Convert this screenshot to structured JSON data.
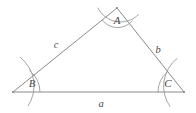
{
  "figure": {
    "type": "geometry-diagram",
    "shape": "triangle",
    "background_color": "#ffffff",
    "stroke_color": "#8a8a8a",
    "label_color": "#4a4a4a",
    "stroke_width": 1
  },
  "vertices": [
    {
      "id": "A",
      "label": "A",
      "x": 117,
      "y": 8,
      "label_x": 117,
      "label_y": 20
    },
    {
      "id": "B",
      "label": "B",
      "x": 13,
      "y": 92,
      "label_x": 32,
      "label_y": 83
    },
    {
      "id": "C",
      "label": "C",
      "x": 184,
      "y": 92,
      "label_x": 168,
      "label_y": 83
    }
  ],
  "sides": [
    {
      "id": "a",
      "label": "a",
      "between": "B-C",
      "label_x": 101,
      "label_y": 104
    },
    {
      "id": "b",
      "label": "b",
      "between": "A-C",
      "label_x": 158,
      "label_y": 50
    },
    {
      "id": "c",
      "label": "c",
      "between": "A-B",
      "label_x": 56,
      "label_y": 45
    }
  ],
  "angle_arcs": [
    {
      "at": "A",
      "kind": "inner"
    },
    {
      "at": "A",
      "kind": "outer"
    },
    {
      "at": "B",
      "kind": "inner"
    },
    {
      "at": "B",
      "kind": "outer"
    },
    {
      "at": "C",
      "kind": "inner"
    },
    {
      "at": "C",
      "kind": "outer"
    }
  ]
}
